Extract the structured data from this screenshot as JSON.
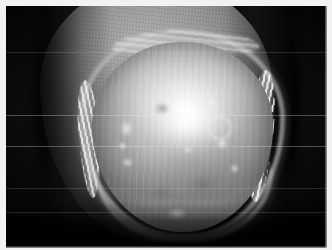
{
  "image": {
    "kind": "clinical-photograph",
    "subject": "fingertip-nail-close-up",
    "color_mode": "grayscale",
    "width_px": 332,
    "height_px": 250,
    "caption": "",
    "overlay_text": "",
    "border": {
      "style": "light paper margin with thin hairline on right and bottom",
      "margin_color": "#f2f2f0",
      "hairline_color": "#cdcdc8",
      "margin_px": 6
    }
  },
  "palette": {
    "background_black": "#030303",
    "background_dark": "#1a1a18",
    "skin_midtone": "#94938e",
    "skin_highlight": "#b0aea8",
    "nail_plate_light": "#eeede8",
    "nail_plate_mid": "#bab9b3",
    "nail_plate_dark": "#82817c",
    "cuticle_white": "#fcfbf7",
    "specular_white": "#ffffff"
  },
  "regions": [
    {
      "name": "background-field",
      "label": "Dark photographic background"
    },
    {
      "name": "finger-body",
      "label": "Distal phalanx soft tissue"
    },
    {
      "name": "proximal-nail-fold",
      "label": "Proximal nail fold and cuticle"
    },
    {
      "name": "lateral-nail-fold-left",
      "label": "Left lateral nail fold"
    },
    {
      "name": "lateral-nail-fold-right",
      "label": "Right lateral nail fold"
    },
    {
      "name": "nail-plate",
      "label": "Nail plate"
    },
    {
      "name": "distal-free-edge",
      "label": "Distal free edge / hyponychium"
    },
    {
      "name": "specular-highlight",
      "label": "Flash specular reflection"
    }
  ],
  "lesions": [
    {
      "id": "l1",
      "type": "pale",
      "x": 28,
      "y": 78,
      "w": 13,
      "h": 17
    },
    {
      "id": "l2",
      "type": "pale",
      "x": 26,
      "y": 100,
      "w": 9,
      "h": 8
    },
    {
      "id": "l3",
      "type": "pale",
      "x": 30,
      "y": 116,
      "w": 11,
      "h": 9
    },
    {
      "id": "l4",
      "type": "ring",
      "x": 118,
      "y": 76,
      "w": 20,
      "h": 20
    },
    {
      "id": "l5",
      "type": "pale",
      "x": 124,
      "y": 96,
      "w": 12,
      "h": 11
    },
    {
      "id": "l6",
      "type": "pale",
      "x": 92,
      "y": 104,
      "w": 8,
      "h": 7
    },
    {
      "id": "l7",
      "type": "pale",
      "x": 116,
      "y": 52,
      "w": 8,
      "h": 16
    },
    {
      "id": "l8",
      "type": "dark",
      "x": 96,
      "y": 132,
      "w": 30,
      "h": 22
    },
    {
      "id": "l9",
      "type": "dark",
      "x": 56,
      "y": 142,
      "w": 26,
      "h": 18
    },
    {
      "id": "l10",
      "type": "pale",
      "x": 74,
      "y": 166,
      "w": 22,
      "h": 12
    },
    {
      "id": "l11",
      "type": "pale",
      "x": 138,
      "y": 122,
      "w": 9,
      "h": 9
    },
    {
      "id": "l12",
      "type": "dark",
      "x": 62,
      "y": 60,
      "w": 16,
      "h": 13
    }
  ],
  "scanlines": [
    {
      "y": 46,
      "opacity": "faint"
    },
    {
      "y": 109,
      "opacity": "normal"
    },
    {
      "y": 140,
      "opacity": "normal"
    },
    {
      "y": 182,
      "opacity": "faint"
    },
    {
      "y": 206,
      "opacity": "faint"
    }
  ]
}
